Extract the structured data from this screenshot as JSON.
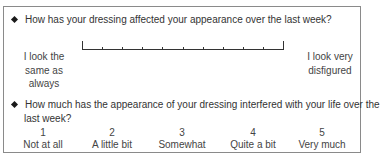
{
  "questions": [
    {
      "text": "How has your dressing affected your appearance over the last week?",
      "type": "visual-analogue-scale",
      "scale": {
        "ticks": 11
      },
      "left_anchor": [
        "I look the",
        "same as",
        "always"
      ],
      "right_anchor": [
        "I look very",
        "disfigured"
      ]
    },
    {
      "text_line1": "How much has the appearance of your dressing interfered with your life over the",
      "text_line2": "last week?",
      "type": "likert",
      "options": [
        {
          "value": "1",
          "label": "Not at all"
        },
        {
          "value": "2",
          "label": "A little bit"
        },
        {
          "value": "3",
          "label": "Somewhat"
        },
        {
          "value": "4",
          "label": "Quite a bit"
        },
        {
          "value": "5",
          "label": "Very much"
        }
      ]
    }
  ]
}
